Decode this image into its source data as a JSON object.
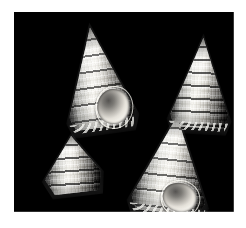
{
  "image": {
    "kind": "photograph",
    "subject": "sea-shells",
    "specimen_count": 4,
    "background_color": "#000000",
    "mount_color": "#ffffff",
    "palette": [
      "#000000",
      "#4a4a4a",
      "#9a9894",
      "#cfcdc8",
      "#efeeea",
      "#ffffff"
    ],
    "field": {
      "left": 14,
      "top": 12,
      "width": 220,
      "height": 200
    },
    "canvas": {
      "width": 246,
      "height": 228
    }
  },
  "specimens": [
    {
      "id": "upper-left",
      "position": "upper left",
      "size": "large",
      "view": "apertural, tilted",
      "has_aperture": true,
      "tone": "pale cream to white"
    },
    {
      "id": "upper-right",
      "position": "upper right",
      "size": "medium",
      "view": "dorsal, spire",
      "has_aperture": false,
      "tone": "grey banded"
    },
    {
      "id": "lower-left",
      "position": "lower left",
      "size": "small",
      "view": "oblique, foreshortened",
      "has_aperture": false,
      "tone": "grey banded"
    },
    {
      "id": "lower-right",
      "position": "lower right",
      "size": "large",
      "view": "apertural, upright",
      "has_aperture": true,
      "tone": "pale grey with dark cords"
    }
  ]
}
